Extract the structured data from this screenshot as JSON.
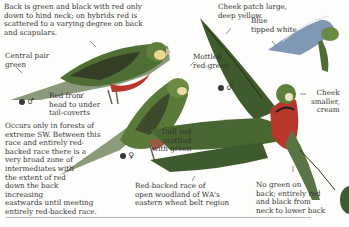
{
  "annotations": {
    "back_note": "Back is green and black with red only\ndown to hind neck; on hybrids red is\nscattered to a varying degree on back\nand scapulars.",
    "cheek_patch": "Cheek patch large,\ndeep yellow.",
    "blue_tipped": "Blue\ntipped white",
    "central_pair": "Central pair\ngreen",
    "mottled": "Mottled\nred-green",
    "red_from_head": "Red from\nhead to under\ntail-coverts",
    "cheek_smaller": "Cheek\nsmaller,\ncream",
    "occurs_only": "Occurs only in forests of\nextreme SW. Between this\nrace and entirely red-\nbacked race there is a\nvery broad zone of\nintermediates with\nthe extent of red\ndown the back\nincreasing\neastwards until meeting\nentirely red-backed race.",
    "dull_red": "Dull red\nmottled\nwith green",
    "red_backed_race": "Red-backed race of\nopen woodland of WA's\neastern wheat belt region",
    "no_green": "No green on\nback; entirely red\nand black from\nneck to lower back"
  },
  "symbols": {
    "male_1": "♂",
    "male_2": "♂",
    "female": "♀"
  },
  "colors": {
    "green_back": "#4f6e34",
    "red_under": "#b8372c",
    "cheek_yellow": "#e8d88a",
    "cheek_cream": "#efe6c8",
    "blue_tip": "#6a86a8",
    "rule": "#b9b9b9"
  }
}
